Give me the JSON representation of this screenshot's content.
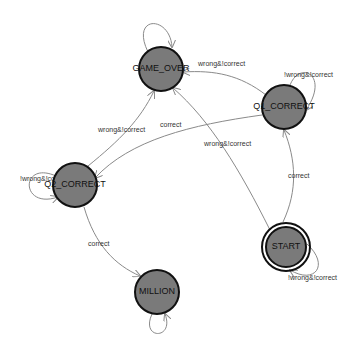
{
  "diagram": {
    "type": "state-machine",
    "nodes": [
      {
        "id": "GAME_OVER",
        "label": "GAME_OVER",
        "x": 161,
        "y": 69,
        "accepting": false
      },
      {
        "id": "Q1_CORRECT",
        "label": "Q1_CORRECT",
        "x": 284,
        "y": 107,
        "accepting": false
      },
      {
        "id": "Q2_CORRECT",
        "label": "Q2_CORRECT",
        "x": 75,
        "y": 185,
        "accepting": false
      },
      {
        "id": "START",
        "label": "START",
        "x": 286,
        "y": 247,
        "accepting": true
      },
      {
        "id": "MILLION",
        "label": "MILLION",
        "x": 157,
        "y": 292,
        "accepting": false
      }
    ],
    "edges": [
      {
        "from": "GAME_OVER",
        "to": "GAME_OVER",
        "label": ""
      },
      {
        "from": "Q1_CORRECT",
        "to": "GAME_OVER",
        "label": "wrong&!correct"
      },
      {
        "from": "Q1_CORRECT",
        "to": "Q1_CORRECT",
        "label": "!wrong&!correct"
      },
      {
        "from": "Q1_CORRECT",
        "to": "Q2_CORRECT",
        "label": "correct"
      },
      {
        "from": "Q2_CORRECT",
        "to": "GAME_OVER",
        "label": "wrong&!correct"
      },
      {
        "from": "Q2_CORRECT",
        "to": "Q2_CORRECT",
        "label": "!wrong&!correct"
      },
      {
        "from": "Q2_CORRECT",
        "to": "MILLION",
        "label": "correct"
      },
      {
        "from": "START",
        "to": "GAME_OVER",
        "label": "wrong&!correct"
      },
      {
        "from": "START",
        "to": "Q1_CORRECT",
        "label": "correct"
      },
      {
        "from": "START",
        "to": "START",
        "label": "!wrong&!correct"
      },
      {
        "from": "MILLION",
        "to": "MILLION",
        "label": ""
      }
    ],
    "colors": {
      "node_fill": "#7a7a7a",
      "node_stroke": "#111111",
      "edge": "#8a8a8a",
      "background": "#ffffff"
    }
  }
}
